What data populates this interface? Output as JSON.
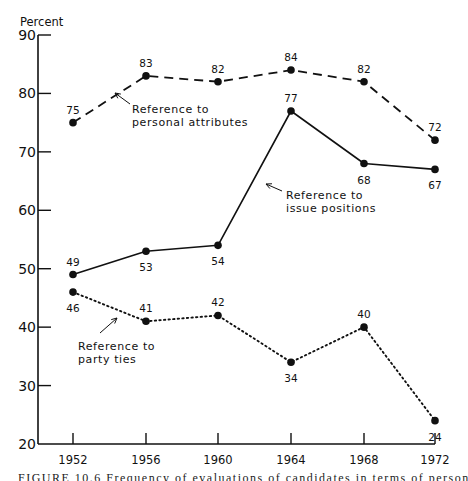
{
  "chart_data": {
    "type": "line",
    "title": "",
    "ylabel": "Percent",
    "xlabel": "",
    "ylim": [
      20,
      90
    ],
    "yticks": [
      20,
      30,
      40,
      50,
      60,
      70,
      80,
      90
    ],
    "categories": [
      "1952",
      "1956",
      "1960",
      "1964",
      "1968",
      "1972"
    ],
    "grid": false,
    "legend": "inline annotations with arrows",
    "series": [
      {
        "name": "Reference to personal attributes",
        "style": "dashed",
        "values": [
          75,
          83,
          82,
          84,
          82,
          72
        ]
      },
      {
        "name": "Reference to issue positions",
        "style": "solid",
        "values": [
          49,
          53,
          54,
          77,
          68,
          67
        ]
      },
      {
        "name": "Reference to party ties",
        "style": "dotted",
        "values": [
          46,
          41,
          42,
          34,
          40,
          24
        ]
      }
    ],
    "annotations": [
      {
        "text": [
          "Reference to",
          "personal attributes"
        ],
        "series": 0
      },
      {
        "text": [
          "Reference to",
          "issue positions"
        ],
        "series": 1
      },
      {
        "text": [
          "Reference to",
          "party ties"
        ],
        "series": 2
      }
    ]
  },
  "caption": "FIGURE 10.6 Frequency of evaluations of candidates in terms of personal"
}
